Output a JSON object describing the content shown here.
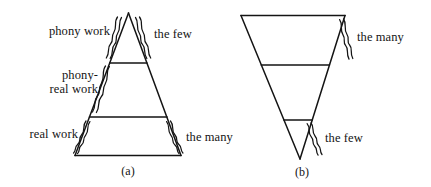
{
  "figure": {
    "background_color": "#ffffff",
    "ink_color": "#141414",
    "panels": [
      {
        "id": "a",
        "caption": "(a)",
        "shape": "upright-triangle",
        "sections": [
          {
            "name": "top",
            "left_label": "phony work",
            "right_label": "the few"
          },
          {
            "name": "middle",
            "left_label": "phony-\nreal work",
            "right_label": ""
          },
          {
            "name": "bottom",
            "left_label": "real work",
            "right_label": "the many"
          }
        ],
        "left_labels": [
          {
            "text": "phony work",
            "lines": 1
          },
          {
            "text": "phony-\nreal work",
            "lines": 2
          },
          {
            "text": "real work",
            "lines": 1
          }
        ],
        "right_labels": [
          {
            "text": "the few"
          },
          {
            "text": "the many"
          }
        ]
      },
      {
        "id": "b",
        "caption": "(b)",
        "shape": "inverted-triangle",
        "sections": [
          {
            "name": "top",
            "left_label": "",
            "right_label": "the many"
          },
          {
            "name": "middle",
            "left_label": "",
            "right_label": ""
          },
          {
            "name": "bottom",
            "left_label": "",
            "right_label": "the few"
          }
        ],
        "left_labels": [],
        "right_labels": [
          {
            "text": "the many"
          },
          {
            "text": "the few"
          }
        ]
      }
    ]
  },
  "labels": {
    "a_phony_work": "phony work",
    "a_phony_real_work": "phony-\nreal work",
    "a_real_work": "real work",
    "a_the_few": "the few",
    "a_the_many": "the many",
    "a_caption": "(a)",
    "b_the_many": "the many",
    "b_the_few": "the few",
    "b_caption": "(b)"
  }
}
